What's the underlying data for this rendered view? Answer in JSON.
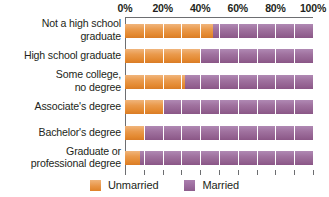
{
  "chart_data": {
    "type": "bar",
    "orientation": "horizontal",
    "stacked": true,
    "normalized": true,
    "title": "",
    "subtitle": "",
    "xlabel": "",
    "ylabel": "",
    "xlim": [
      0,
      100
    ],
    "grid": true,
    "grid_axis": "x",
    "legend_position": "bottom",
    "tick_labels": [
      "0%",
      "20%",
      "40%",
      "60%",
      "80%",
      "100%"
    ],
    "tick_values": [
      0,
      20,
      40,
      60,
      80,
      100
    ],
    "gridline_values": [
      0,
      10,
      20,
      30,
      40,
      50,
      60,
      70,
      80,
      90,
      100
    ],
    "categories": [
      "Not a high school graduate",
      "High school graduate",
      "Some college, no degree",
      "Associate's degree",
      "Bachelor's degree",
      "Graduate or professional degree"
    ],
    "category_label_lines": [
      [
        "Not a high school",
        "graduate"
      ],
      [
        "High school graduate"
      ],
      [
        "Some college,",
        "no degree"
      ],
      [
        "Associate's degree"
      ],
      [
        "Bachelor's degree"
      ],
      [
        "Graduate or",
        "professional degree"
      ]
    ],
    "series": [
      {
        "name": "Unmarried",
        "color": "#e8933f",
        "values": [
          47,
          40,
          32,
          21,
          10,
          8
        ]
      },
      {
        "name": "Married",
        "color": "#9b6a9e",
        "values": [
          53,
          60,
          68,
          79,
          90,
          92
        ]
      }
    ]
  },
  "legend": {
    "items": [
      {
        "label": "Unmarried",
        "swatch": "unmarried"
      },
      {
        "label": "Married",
        "swatch": "married"
      }
    ]
  },
  "colors": {
    "unmarried": "#e8933f",
    "married": "#9b6a9e",
    "axis": "#6d6e71",
    "text": "#231f20",
    "background": "#ffffff",
    "gridline": "#ffffff"
  }
}
